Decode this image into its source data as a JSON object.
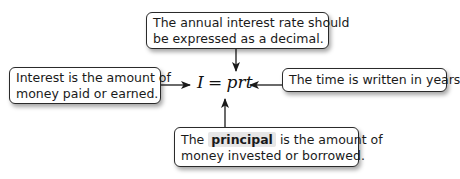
{
  "diagram": {
    "formula": {
      "lhs": "I",
      "equals": "=",
      "rhs": "prt"
    },
    "callouts": {
      "rate": {
        "lines": [
          "The annual interest rate should",
          "be expressed as a decimal."
        ]
      },
      "interest": {
        "lines": [
          "Interest is the amount of",
          "money paid or earned."
        ]
      },
      "time": {
        "lines": [
          "The time is written in years."
        ]
      },
      "principal": {
        "prefix": "The",
        "highlight": "principal",
        "suffix": "is the amount of",
        "line2": "money invested or borrowed."
      }
    },
    "colors": {
      "border": "#2a2a2a",
      "text": "#1a1a1a",
      "highlight_bg": "#e6e6e6",
      "arrow": "#1a1a1a"
    }
  }
}
